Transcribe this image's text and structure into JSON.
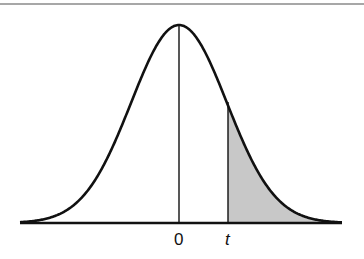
{
  "diagram": {
    "title": "",
    "labels": {
      "center": "0",
      "threshold": "t"
    },
    "colors": {
      "curve": "#111111",
      "shade": "#c8c8c8",
      "rule": "#8a8a8a"
    }
  },
  "chart_data": {
    "type": "area",
    "title": "",
    "xlabel": "",
    "ylabel": "",
    "x_tick_labels": [
      "0",
      "t"
    ],
    "curve": "normal density",
    "shaded_region": "x > t (upper tail)",
    "grid": false,
    "legend": null
  }
}
